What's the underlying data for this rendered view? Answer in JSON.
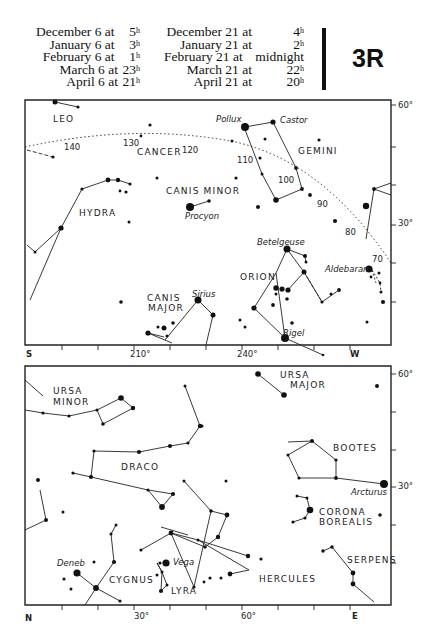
{
  "header": {
    "left_column": [
      {
        "text": "December 6 at",
        "hour": "5",
        "unit": "h"
      },
      {
        "text": "January 6 at",
        "hour": "3",
        "unit": "h"
      },
      {
        "text": "February 6 at",
        "hour": "1",
        "unit": "h"
      },
      {
        "text": "March 6 at",
        "hour": "23",
        "unit": "h"
      },
      {
        "text": "April 6 at",
        "hour": "21",
        "unit": "h"
      }
    ],
    "right_column": [
      {
        "text": "December 21 at",
        "hour": "4",
        "unit": "h"
      },
      {
        "text": "January 21 at",
        "hour": "2",
        "unit": "h"
      },
      {
        "text": "February 21 at",
        "hour": "midnight",
        "unit": ""
      },
      {
        "text": "March 21 at",
        "hour": "22",
        "unit": "h"
      },
      {
        "text": "April 21 at",
        "hour": "20",
        "unit": "h"
      }
    ],
    "chart_code": "3R"
  },
  "south_map": {
    "constellations": {
      "leo": "LEO",
      "cancer": "CANCER",
      "gemini": "GEMINI",
      "hydra": "HYDRA",
      "canis_minor": "CANIS MINOR",
      "orion": "ORION",
      "canis_major_1": "CANIS",
      "canis_major_2": "MAJOR"
    },
    "stars": {
      "pollux": "Pollux",
      "castor": "Castor",
      "procyon": "Procyon",
      "betelgeuse": "Betelgeuse",
      "aldebaran": "Aldebaran",
      "sirius": "Sirius",
      "rigel": "Rigel"
    },
    "ecliptic_ticks": [
      "140",
      "130",
      "120",
      "110",
      "100",
      "90",
      "80",
      "70"
    ],
    "axis": {
      "left": "S",
      "right": "W",
      "x_ticks": [
        "210°",
        "240°"
      ],
      "y_ticks": [
        "60°",
        "30°"
      ]
    }
  },
  "north_map": {
    "constellations": {
      "ursa_minor_1": "URSA",
      "ursa_minor_2": "MINOR",
      "ursa_major_1": "URSA",
      "ursa_major_2": "MAJOR",
      "draco": "DRACO",
      "bootes": "BOOTES",
      "corona_1": "CORONA",
      "corona_2": "BOREALIS",
      "cygnus": "CYGNUS",
      "lyra": "LYRA",
      "hercules": "HERCULES",
      "serpens": "SERPENS"
    },
    "stars": {
      "arcturus": "Arcturus",
      "deneb": "Deneb",
      "vega": "Vega"
    },
    "axis": {
      "left": "N",
      "right": "E",
      "x_ticks": [
        "30°",
        "60°"
      ],
      "y_ticks": [
        "60°",
        "30°"
      ]
    }
  }
}
